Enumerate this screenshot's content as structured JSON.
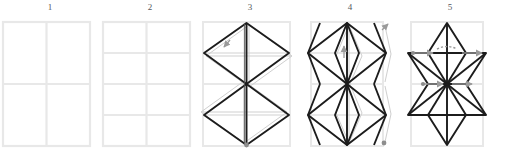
{
  "diagram": {
    "type": "origami-instruction-sequence",
    "panel_count": 5,
    "colors": {
      "background": "#ffffff",
      "grid_crease": "#e8e8e8",
      "ghost_crease": "#d2d2d2",
      "fold_line": "#1c1c1c",
      "arrow": "#9a9a9a",
      "number_text": "#55585c"
    },
    "panels": [
      {
        "number": "1",
        "name": "panel-1",
        "description": "Flat rectangle divided into a 2 by 2 grid of creases",
        "grid_columns": 2,
        "grid_rows": 2,
        "has_folds": false,
        "arrow_count": 0
      },
      {
        "number": "2",
        "name": "panel-2",
        "description": "Rectangle divided into a 2 by 4 grid of creases",
        "grid_columns": 2,
        "grid_rows": 4,
        "has_folds": false,
        "arrow_count": 0
      },
      {
        "number": "3",
        "name": "panel-3",
        "description": "Two large diamonds meeting at the centre forming an hourglass, with a shifted ghost outline",
        "grid_columns": 2,
        "grid_rows": 4,
        "has_folds": true,
        "arrow_count": 2
      },
      {
        "number": "4",
        "name": "panel-4",
        "description": "Diamonds with inner narrow diamonds and side flaps folded outward past the edges",
        "grid_columns": 2,
        "grid_rows": 4,
        "has_folds": true,
        "arrow_count": 3
      },
      {
        "number": "5",
        "name": "panel-5",
        "description": "Completed star form with creases radiating from the centre point and horizontal pull arrows",
        "grid_columns": 2,
        "grid_rows": 4,
        "has_folds": true,
        "arrow_count": 5
      }
    ]
  }
}
